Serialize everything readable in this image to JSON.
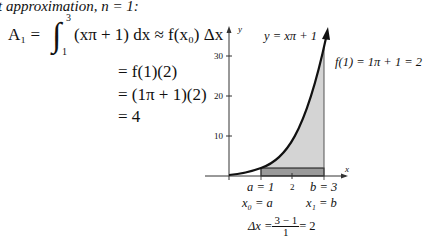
{
  "heading": "t approximation, n = 1:",
  "derivation": {
    "line1_lhs": "A₁ = ",
    "integral_upper": "3",
    "integral_lower": "1",
    "integrand": "(xπ + 1) dx ≈ f(x₀) Δx",
    "line2": "= f(1)(2)",
    "line3": "= (1π + 1)(2)",
    "line4": "= 4"
  },
  "figure": {
    "curve_label": "y = xπ + 1",
    "f_label": "f(1) = 1π + 1 = 2",
    "y_axis_label": "y",
    "x_axis_label": "x",
    "y_ticks": [
      "30",
      "20",
      "10"
    ],
    "x_tick_mid": "2",
    "a_label": "a = 1",
    "b_label": "b = 3",
    "x0_label": "x₀ = a",
    "x1_label": "x₁ = b",
    "dx_lhs": "Δx = ",
    "dx_num": "3 − 1",
    "dx_den": "1",
    "dx_rhs": " = 2",
    "colors": {
      "light_fill": "#d4d4d4",
      "dark_fill": "#9a9a9a",
      "curve": "#111111"
    }
  }
}
